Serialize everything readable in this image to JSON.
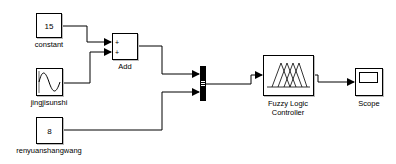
{
  "diagram": {
    "type": "simulink-model",
    "blocks": [
      {
        "id": "constant",
        "kind": "Constant",
        "value": "15",
        "label": "constant"
      },
      {
        "id": "jingjisunshi",
        "kind": "Sine Wave",
        "label": "jingjisunshi"
      },
      {
        "id": "renyuanshangwang",
        "kind": "Constant",
        "value": "8",
        "label": "renyuanshangwang"
      },
      {
        "id": "add",
        "kind": "Sum",
        "label": "Add",
        "signs": [
          "+",
          "+"
        ]
      },
      {
        "id": "mux",
        "kind": "Mux",
        "label": ""
      },
      {
        "id": "fuzzy",
        "kind": "Fuzzy Logic Controller",
        "label_line1": "Fuzzy Logic",
        "label_line2": "Controller"
      },
      {
        "id": "scope",
        "kind": "Scope",
        "label": "Scope"
      }
    ],
    "connections": [
      {
        "from": "constant",
        "to": "add",
        "port": 1
      },
      {
        "from": "jingjisunshi",
        "to": "add",
        "port": 2
      },
      {
        "from": "add",
        "to": "mux",
        "port": 1
      },
      {
        "from": "renyuanshangwang",
        "to": "mux",
        "port": 2
      },
      {
        "from": "mux",
        "to": "fuzzy",
        "port": 1
      },
      {
        "from": "fuzzy",
        "to": "scope",
        "port": 1
      }
    ]
  }
}
